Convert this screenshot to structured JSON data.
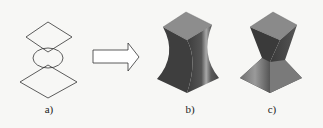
{
  "figure": {
    "panels": [
      {
        "id": "a",
        "label": "a)",
        "description": "2D profile: upper diamond, ellipse, lower diamond"
      },
      {
        "id": "arrow",
        "description": "hollow right arrow"
      },
      {
        "id": "b",
        "label": "b)",
        "description": "3D lofted solid with smooth curved waist"
      },
      {
        "id": "c",
        "label": "c)",
        "description": "3D lofted solid with faceted waist"
      }
    ]
  },
  "colors": {
    "background": "#f7f7f5",
    "stroke": "#333333",
    "solid_top": "#8a8a8a",
    "solid_dark": "#3a3a3a",
    "solid_mid": "#6a6a6a",
    "solid_light": "#9a9a9a"
  }
}
